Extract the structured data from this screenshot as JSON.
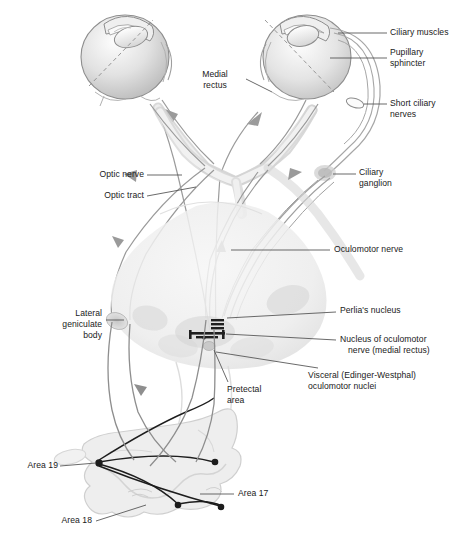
{
  "diagram": {
    "type": "anatomical-schematic",
    "colors": {
      "outline": "#8a8a8a",
      "tissue_fill": "#e9e9e9",
      "shadow": "#cfcfcf",
      "fiber_dark": "#1a1a1a",
      "fiber_grey": "#9a9a9a",
      "label_text": "#1a1a1a",
      "leader_line": "#555555",
      "background": "#ffffff"
    }
  },
  "labels": {
    "ciliary_muscles": "Ciliary muscles",
    "pupillary_sphincter_l1": "Pupillary",
    "pupillary_sphincter_l2": "sphincter",
    "short_ciliary_l1": "Short ciliary",
    "short_ciliary_l2": "nerves",
    "ciliary_ganglion_l1": "Ciliary",
    "ciliary_ganglion_l2": "ganglion",
    "medial_rectus_l1": "Medial",
    "medial_rectus_l2": "rectus",
    "optic_nerve": "Optic nerve",
    "optic_tract": "Optic tract",
    "oculomotor_nerve": "Oculomotor nerve",
    "perlia_nucleus": "Perlia's nucleus",
    "nucleus_oculomotor_l1": "Nucleus of oculomotor",
    "nucleus_oculomotor_l2": "nerve (medial rectus)",
    "visceral_ew_l1": "Visceral (Edinger-Westphal)",
    "visceral_ew_l2": "oculomotor nuclei",
    "lateral_geniculate_l1": "Lateral",
    "lateral_geniculate_l2": "geniculate",
    "lateral_geniculate_l3": "body",
    "pretectal_area_l1": "Pretectal",
    "pretectal_area_l2": "area",
    "area_19": "Area 19",
    "area_17": "Area 17",
    "area_18": "Area 18"
  },
  "structures": [
    {
      "name": "left-eyeball",
      "label": null
    },
    {
      "name": "right-eyeball",
      "label": null
    },
    {
      "name": "optic-chiasm",
      "label": null
    },
    {
      "name": "brainstem-midbrain",
      "label": null
    },
    {
      "name": "occipital-cortex",
      "label": null
    },
    {
      "name": "ciliary-ganglion-node",
      "label": "Ciliary ganglion"
    },
    {
      "name": "lateral-geniculate-body-node",
      "label": "Lateral geniculate body"
    },
    {
      "name": "pretectal-area-node",
      "label": "Pretectal area"
    },
    {
      "name": "oculomotor-nuclei-block",
      "label": "Visceral (Edinger-Westphal) oculomotor nuclei"
    }
  ]
}
